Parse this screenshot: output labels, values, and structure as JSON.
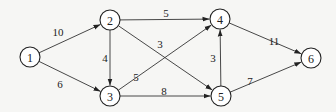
{
  "diagram": {
    "type": "directed-weighted-graph",
    "nodes": [
      {
        "id": "1",
        "label": "1",
        "x": 30,
        "y": 57
      },
      {
        "id": "2",
        "label": "2",
        "x": 110,
        "y": 20
      },
      {
        "id": "3",
        "label": "3",
        "x": 110,
        "y": 96
      },
      {
        "id": "4",
        "label": "4",
        "x": 220,
        "y": 19
      },
      {
        "id": "5",
        "label": "5",
        "x": 221,
        "y": 96
      },
      {
        "id": "6",
        "label": "6",
        "x": 311,
        "y": 58
      }
    ],
    "edges": [
      {
        "from": "1",
        "to": "2",
        "weight": "10",
        "lx": 58,
        "ly": 32
      },
      {
        "from": "1",
        "to": "3",
        "weight": "6",
        "lx": 60,
        "ly": 84
      },
      {
        "from": "2",
        "to": "3",
        "weight": "4",
        "lx": 105,
        "ly": 58
      },
      {
        "from": "2",
        "to": "4",
        "weight": "5",
        "lx": 166,
        "ly": 13
      },
      {
        "from": "2",
        "to": "5",
        "weight": "3",
        "lx": 160,
        "ly": 44
      },
      {
        "from": "3",
        "to": "4",
        "weight": "5",
        "lx": 136,
        "ly": 77
      },
      {
        "from": "3",
        "to": "5",
        "weight": "8",
        "lx": 164,
        "ly": 91
      },
      {
        "from": "5",
        "to": "4",
        "weight": "3",
        "lx": 213,
        "ly": 58
      },
      {
        "from": "4",
        "to": "6",
        "weight": "11",
        "lx": 274,
        "ly": 41
      },
      {
        "from": "5",
        "to": "6",
        "weight": "7",
        "lx": 250,
        "ly": 81
      }
    ],
    "node_radius": 10,
    "colors": {
      "stroke": "#222222",
      "background": "#f6f6f4"
    }
  }
}
